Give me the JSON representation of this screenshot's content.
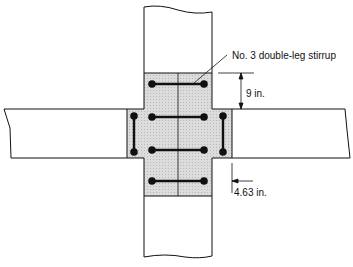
{
  "diagram": {
    "labels": {
      "stirrup": "No. 3 double-leg stirrup",
      "spacing_top": "9 in.",
      "spacing_side": "4.63 in."
    },
    "colors": {
      "line": "#111111",
      "shading": "#d6d6d6",
      "background": "#ffffff"
    }
  }
}
